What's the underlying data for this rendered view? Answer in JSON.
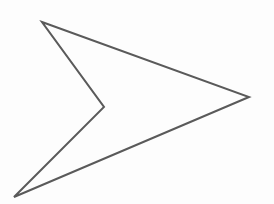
{
  "figure": {
    "shape": "arrowhead",
    "stroke_color": "#5a5a5a",
    "fill_color": "none",
    "background_color": "#fdfdfd",
    "stroke_width": 2,
    "points": [
      [
        42,
        22
      ],
      [
        249,
        97
      ],
      [
        14,
        197
      ],
      [
        104,
        107
      ]
    ]
  }
}
